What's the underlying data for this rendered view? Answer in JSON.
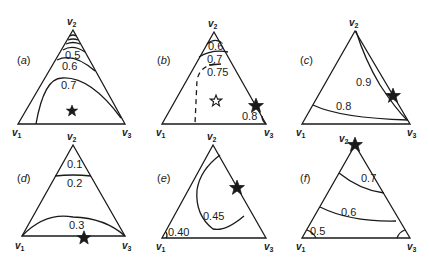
{
  "figure": {
    "vertex_labels": {
      "v1": "v",
      "v1_sub": "1",
      "v2": "v",
      "v2_sub": "2",
      "v3": "v",
      "v3_sub": "3"
    },
    "panels": [
      {
        "id": "a",
        "label_open": "(",
        "label_letter": "a",
        "label_close": ")",
        "contours": [
          {
            "value": "0.5",
            "style": "solid"
          },
          {
            "value": "0.6",
            "style": "solid"
          },
          {
            "value": "0.7",
            "style": "solid"
          }
        ],
        "extra_unlabeled_contours_near_v2": 3,
        "star": {
          "type": "solid",
          "location": "interior, lower center"
        }
      },
      {
        "id": "b",
        "label_open": "(",
        "label_letter": "b",
        "label_close": ")",
        "contours": [
          {
            "value": "0.6",
            "style": "solid"
          },
          {
            "value": "0.7",
            "style": "solid"
          },
          {
            "value": "0.75",
            "style": "dashed"
          },
          {
            "value": "0.8",
            "style": "solid"
          }
        ],
        "star": {
          "type": "open",
          "location": "interior, center"
        },
        "star2": {
          "type": "solid",
          "location": "on edge v2-v3 near v3"
        }
      },
      {
        "id": "c",
        "label_open": "(",
        "label_letter": "c",
        "label_close": ")",
        "contours": [
          {
            "value": "0.9",
            "style": "solid"
          },
          {
            "value": "0.8",
            "style": "solid"
          }
        ],
        "star": {
          "type": "solid",
          "location": "on edge v2-v3"
        }
      },
      {
        "id": "d",
        "label_open": "(",
        "label_letter": "d",
        "label_close": ")",
        "contours": [
          {
            "value": "0.1",
            "style": "solid"
          },
          {
            "value": "0.2",
            "style": "solid"
          },
          {
            "value": "0.3",
            "style": "solid"
          }
        ],
        "star": {
          "type": "solid",
          "location": "on edge v1-v3"
        }
      },
      {
        "id": "e",
        "label_open": "(",
        "label_letter": "e",
        "label_close": ")",
        "contours": [
          {
            "value": "0.45",
            "style": "solid"
          },
          {
            "value": "0.40",
            "style": "solid"
          }
        ],
        "star": {
          "type": "solid",
          "location": "on edge v2-v3"
        }
      },
      {
        "id": "f",
        "label_open": "(",
        "label_letter": "f",
        "label_close": ")",
        "contours": [
          {
            "value": "0.7",
            "style": "solid"
          },
          {
            "value": "0.6",
            "style": "solid"
          },
          {
            "value": "0.5",
            "style": "solid"
          }
        ],
        "star": {
          "type": "solid",
          "location": "at vertex v2"
        }
      }
    ]
  }
}
